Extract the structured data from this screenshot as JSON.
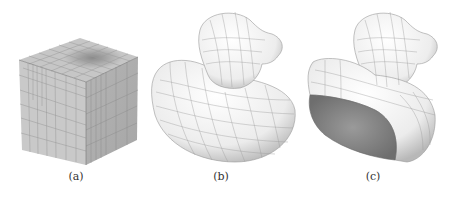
{
  "figure": {
    "panels": [
      {
        "id": "a",
        "label": "(a)",
        "subject": "hexahedral mesh cube with adaptive refinement"
      },
      {
        "id": "b",
        "label": "(b)",
        "subject": "rubber duck surface with quad mesh lines"
      },
      {
        "id": "c",
        "label": "(c)",
        "subject": "rubber duck cut open showing interior volume"
      }
    ]
  }
}
